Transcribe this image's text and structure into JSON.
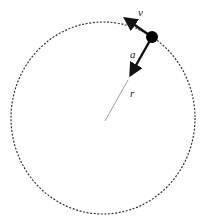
{
  "diagram": {
    "colors": {
      "path": "#333333",
      "vector": "#111111",
      "radius": "#888888",
      "particle": "#000000",
      "background": "#ffffff"
    },
    "orbit": {
      "center": [
        103,
        118
      ],
      "rx": 92,
      "ry": 96,
      "style": "dotted"
    },
    "particle": {
      "position": [
        152,
        37
      ],
      "radius": 6
    },
    "vectors": [
      {
        "id": "velocity",
        "label": "v",
        "from": [
          152,
          37
        ],
        "to": [
          122,
          16
        ],
        "label_pos": [
          138,
          8
        ]
      },
      {
        "id": "acceleration",
        "label": "a",
        "from": [
          152,
          37
        ],
        "to": [
          128,
          79
        ],
        "label_pos": [
          130,
          49
        ]
      }
    ],
    "radius_line": {
      "label": "r",
      "from": [
        128,
        79
      ],
      "to": [
        105,
        121
      ],
      "label_pos": [
        130,
        88
      ]
    }
  }
}
